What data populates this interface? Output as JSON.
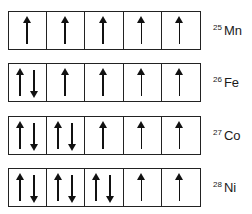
{
  "diagram": {
    "type": "orbital-box-diagram",
    "rows": [
      {
        "mass_number": "25",
        "symbol": "Mn",
        "top": 11,
        "cells": [
          "up",
          "up",
          "up",
          "up",
          "up"
        ]
      },
      {
        "mass_number": "26",
        "symbol": "Fe",
        "top": 63,
        "cells": [
          "updown",
          "up",
          "up",
          "up",
          "up"
        ]
      },
      {
        "mass_number": "27",
        "symbol": "Co",
        "top": 116,
        "cells": [
          "updown",
          "updown",
          "up",
          "up",
          "up"
        ]
      },
      {
        "mass_number": "28",
        "symbol": "Ni",
        "top": 168,
        "cells": [
          "updown",
          "updown",
          "updown",
          "up",
          "up"
        ]
      }
    ]
  }
}
